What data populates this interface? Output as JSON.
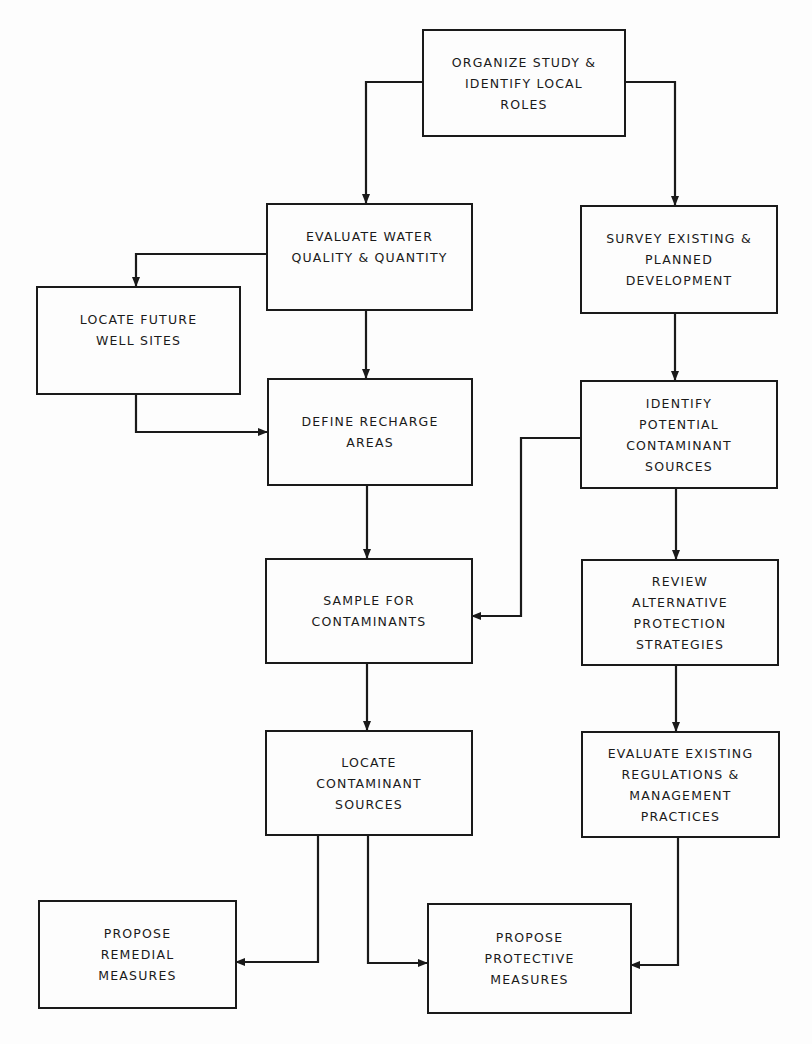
{
  "diagram": {
    "type": "flowchart",
    "nodes": {
      "organize": {
        "lines": [
          "ORGANIZE STUDY &",
          "IDENTIFY LOCAL",
          "ROLES"
        ]
      },
      "evaluate_water": {
        "lines": [
          "EVALUATE WATER",
          "QUALITY & QUANTITY"
        ]
      },
      "survey": {
        "lines": [
          "SURVEY EXISTING &",
          "PLANNED",
          "DEVELOPMENT"
        ]
      },
      "locate_wells": {
        "lines": [
          "LOCATE FUTURE",
          "WELL SITES"
        ]
      },
      "define_recharge": {
        "lines": [
          "DEFINE RECHARGE",
          "AREAS"
        ]
      },
      "identify_sources": {
        "lines": [
          "IDENTIFY",
          "POTENTIAL",
          "CONTAMINANT",
          "SOURCES"
        ]
      },
      "sample": {
        "lines": [
          "SAMPLE FOR",
          "CONTAMINANTS"
        ]
      },
      "review": {
        "lines": [
          "REVIEW",
          "ALTERNATIVE",
          "PROTECTION",
          "STRATEGIES"
        ]
      },
      "locate_sources": {
        "lines": [
          "LOCATE",
          "CONTAMINANT",
          "SOURCES"
        ]
      },
      "evaluate_regs": {
        "lines": [
          "EVALUATE EXISTING",
          "REGULATIONS &",
          "MANAGEMENT",
          "PRACTICES"
        ]
      },
      "remedial": {
        "lines": [
          "PROPOSE",
          "REMEDIAL",
          "MEASURES"
        ]
      },
      "protective": {
        "lines": [
          "PROPOSE",
          "PROTECTIVE",
          "MEASURES"
        ]
      }
    },
    "edges": [
      [
        "ORGANIZE STUDY & IDENTIFY LOCAL ROLES",
        "EVALUATE WATER QUALITY & QUANTITY"
      ],
      [
        "ORGANIZE STUDY & IDENTIFY LOCAL ROLES",
        "SURVEY EXISTING & PLANNED DEVELOPMENT"
      ],
      [
        "EVALUATE WATER QUALITY & QUANTITY",
        "LOCATE FUTURE WELL SITES"
      ],
      [
        "EVALUATE WATER QUALITY & QUANTITY",
        "DEFINE RECHARGE AREAS"
      ],
      [
        "LOCATE FUTURE WELL SITES",
        "DEFINE RECHARGE AREAS"
      ],
      [
        "SURVEY EXISTING & PLANNED DEVELOPMENT",
        "IDENTIFY POTENTIAL CONTAMINANT SOURCES"
      ],
      [
        "DEFINE RECHARGE AREAS",
        "SAMPLE FOR CONTAMINANTS"
      ],
      [
        "IDENTIFY POTENTIAL CONTAMINANT SOURCES",
        "SAMPLE FOR CONTAMINANTS"
      ],
      [
        "IDENTIFY POTENTIAL CONTAMINANT SOURCES",
        "REVIEW ALTERNATIVE PROTECTION STRATEGIES"
      ],
      [
        "SAMPLE FOR CONTAMINANTS",
        "LOCATE CONTAMINANT SOURCES"
      ],
      [
        "REVIEW ALTERNATIVE PROTECTION STRATEGIES",
        "EVALUATE EXISTING REGULATIONS & MANAGEMENT PRACTICES"
      ],
      [
        "LOCATE CONTAMINANT SOURCES",
        "PROPOSE REMEDIAL MEASURES"
      ],
      [
        "LOCATE CONTAMINANT SOURCES",
        "PROPOSE PROTECTIVE MEASURES"
      ],
      [
        "EVALUATE EXISTING REGULATIONS & MANAGEMENT PRACTICES",
        "PROPOSE PROTECTIVE MEASURES"
      ]
    ],
    "colors": {
      "ink": "#1a1a1a",
      "paper": "#fdfdfd"
    }
  }
}
